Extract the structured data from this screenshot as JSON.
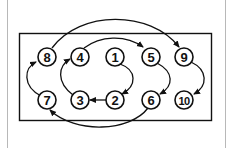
{
  "diagram": {
    "type": "bolt-tightening-sequence",
    "colors": {
      "line": "#111111",
      "background": "#ffffff",
      "border": "#b8b8b8"
    },
    "bolts": [
      {
        "label": "8",
        "row": "top",
        "col": 0
      },
      {
        "label": "4",
        "row": "top",
        "col": 1
      },
      {
        "label": "1",
        "row": "top",
        "col": 2
      },
      {
        "label": "5",
        "row": "top",
        "col": 3
      },
      {
        "label": "9",
        "row": "top",
        "col": 4
      },
      {
        "label": "7",
        "row": "bottom",
        "col": 0
      },
      {
        "label": "3",
        "row": "bottom",
        "col": 1
      },
      {
        "label": "2",
        "row": "bottom",
        "col": 2
      },
      {
        "label": "6",
        "row": "bottom",
        "col": 3
      },
      {
        "label": "10",
        "row": "bottom",
        "col": 4
      }
    ],
    "sequence": [
      "1",
      "2",
      "3",
      "4",
      "5",
      "6",
      "7",
      "8",
      "9",
      "10"
    ]
  }
}
